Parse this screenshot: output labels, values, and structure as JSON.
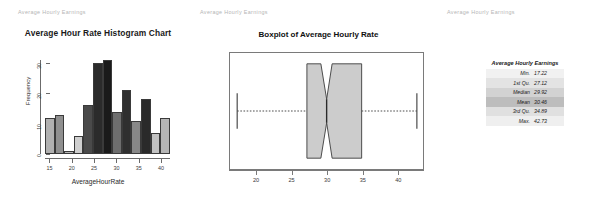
{
  "page_headers": [
    {
      "name": "header-left",
      "text": "Average Hourly Earnings"
    },
    {
      "name": "header-middle",
      "text": "Average Hourly Earnings"
    },
    {
      "name": "header-right",
      "text": "Average Hourly Earnings"
    }
  ],
  "chart_data": [
    {
      "type": "bar",
      "title": "Average Hour Rate Histogram Chart",
      "xlabel": "AverageHourRate",
      "ylabel": "Frequency",
      "xlim": [
        14,
        42
      ],
      "ylim": [
        0,
        31
      ],
      "xticks": [
        15,
        20,
        25,
        30,
        35,
        40
      ],
      "yticks": [
        0,
        10,
        20,
        30
      ],
      "grid": false,
      "legend": "none",
      "bin_width": 2,
      "categories": [
        "16-18",
        "18-20",
        "20-22",
        "22-24",
        "24-26",
        "26-28",
        "28-30",
        "30-32",
        "32-34",
        "34-36",
        "36-38",
        "38-40",
        "40-42"
      ],
      "bin_starts": [
        16,
        18,
        20,
        22,
        24,
        26,
        28,
        30,
        32,
        34,
        36,
        38,
        40
      ],
      "values": [
        12,
        13,
        1,
        6,
        16,
        30,
        31,
        14,
        21,
        11,
        18,
        7,
        12
      ],
      "bar_colors": [
        "#b0b0b0",
        "#8f8f8f",
        "#b8b8b8",
        "#cfcfcf",
        "#4a4a4a",
        "#2b2b2b",
        "#1a1a1a",
        "#6e6e6e",
        "#2f2f2f",
        "#888888",
        "#2a2a2a",
        "#c2c2c2",
        "#b5b5b5"
      ]
    },
    {
      "type": "boxplot",
      "title": "Boxplot of Average Hourly Rate",
      "orientation": "horizontal",
      "xlim": [
        16.2,
        43.6
      ],
      "xticks": [
        20,
        25,
        30,
        35,
        40
      ],
      "grid": false,
      "notched": true,
      "box_fill": "#cccccc",
      "box_line": "#4a4a4a",
      "stats": {
        "min": 17.22,
        "q1": 27.12,
        "median": 29.92,
        "q3": 34.89,
        "max": 42.73,
        "notch_lower": 29.1,
        "notch_upper": 30.7
      }
    }
  ],
  "stats_table": {
    "caption": "Average Hourly Earnings",
    "rows": [
      {
        "label": "Min.",
        "value": "17.22",
        "shade": "#f1f1f1"
      },
      {
        "label": "1st Qu.",
        "value": "27.12",
        "shade": "#e3e3e3"
      },
      {
        "label": "Median",
        "value": "29.92",
        "shade": "#d2d2d2"
      },
      {
        "label": "Mean",
        "value": "30.46",
        "shade": "#bdbdbd"
      },
      {
        "label": "3rd Qu.",
        "value": "34.89",
        "shade": "#e0e0e0"
      },
      {
        "label": "Max.",
        "value": "42.73",
        "shade": "#efefef"
      }
    ]
  }
}
